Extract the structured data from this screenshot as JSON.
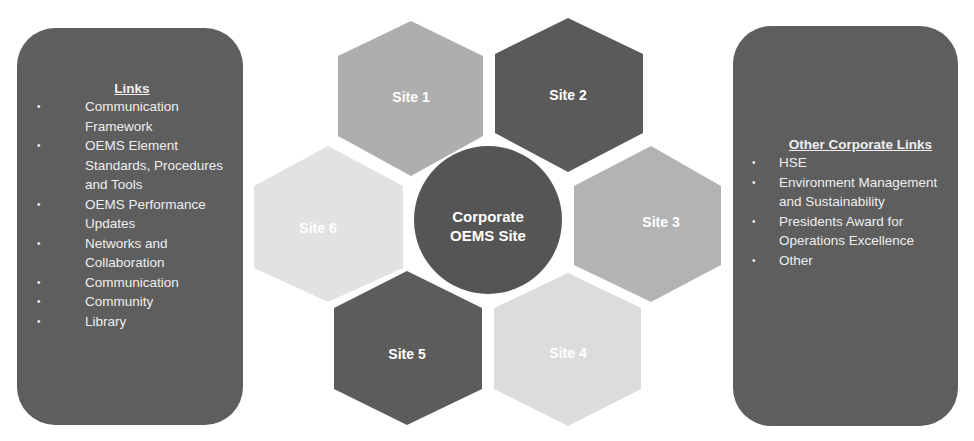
{
  "left_panel": {
    "title": "Links",
    "items": [
      "Communication Framework",
      "OEMS Element Standards, Procedures and Tools",
      "OEMS Performance Updates",
      "Networks and Collaboration",
      "Communication",
      "Community",
      "Library"
    ]
  },
  "right_panel": {
    "title": "Other Corporate Links",
    "items": [
      "HSE",
      "Environment Management and Sustainability",
      "Presidents Award for Operations Excellence",
      "Other"
    ]
  },
  "center": {
    "label_line1": "Corporate",
    "label_line2": "OEMS Site",
    "color": "#555555"
  },
  "sites": [
    {
      "label": "Site 1",
      "color": "#aeaeae"
    },
    {
      "label": "Site 2",
      "color": "#5a5a5a"
    },
    {
      "label": "Site 3",
      "color": "#b3b3b3"
    },
    {
      "label": "Site 4",
      "color": "#dcdcdc"
    },
    {
      "label": "Site 5",
      "color": "#5c5c5c"
    },
    {
      "label": "Site 6",
      "color": "#e2e2e2"
    }
  ],
  "bullet": "•"
}
